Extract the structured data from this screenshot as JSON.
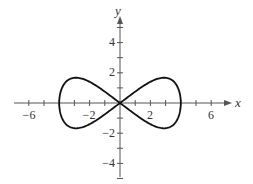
{
  "chart_data": {
    "type": "line",
    "title": "",
    "xlabel": "x",
    "ylabel": "y",
    "xlim": [
      -7.5,
      8
    ],
    "ylim": [
      -5.5,
      6
    ],
    "x_ticks": [
      -6,
      -2,
      2,
      6
    ],
    "y_ticks": [
      4,
      2,
      -2,
      -4
    ],
    "x_tick_labels": [
      "−6",
      "−2",
      "2",
      "6"
    ],
    "y_tick_labels": [
      "4",
      "2",
      "−2",
      "−4"
    ],
    "grid": false,
    "legend": null,
    "series": [
      {
        "name": "figure-eight curve (lemniscate-like, through origin, x-intercepts ±4)",
        "color": "#111111",
        "x": [
          0,
          1,
          2,
          2.8,
          3.5,
          4,
          3.5,
          2.8,
          2,
          1,
          0,
          -1,
          -2,
          -2.8,
          -3.5,
          -4,
          -3.5,
          -2.8,
          -2,
          -1,
          0
        ],
        "y": [
          0,
          1.1,
          1.6,
          1.65,
          1.2,
          0,
          -1.2,
          -1.65,
          -1.6,
          -1.1,
          0,
          1.1,
          1.6,
          1.65,
          1.2,
          0,
          -1.2,
          -1.65,
          -1.6,
          -1.1,
          0
        ]
      }
    ]
  },
  "labels": {
    "x_axis": "x",
    "y_axis": "y",
    "xt": [
      "−6",
      "−2",
      "2",
      "6"
    ],
    "yt": [
      "4",
      "2",
      "−2",
      "−4"
    ]
  }
}
